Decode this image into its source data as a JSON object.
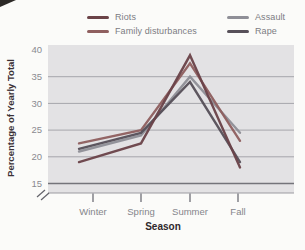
{
  "figure": {
    "background": "#fbfbf9",
    "plot_background": "#e3e2e4",
    "gridline_color": "#a6a6ac",
    "baseline_color": "#74747a",
    "tick_color": "#63636b",
    "tick_label_color": "#8a8a90",
    "category_label_color": "#85858b",
    "axis_title_color": "#3a3136"
  },
  "legend": {
    "items": [
      {
        "id": "riots",
        "label": "Riots",
        "color": "#6b4348"
      },
      {
        "id": "family",
        "label": "Family disturbances",
        "color": "#8f5f5f"
      },
      {
        "id": "assault",
        "label": "Assault",
        "color": "#8f8f97"
      },
      {
        "id": "rape",
        "label": "Rape",
        "color": "#575059"
      }
    ]
  },
  "chart_data": {
    "type": "line",
    "title": "",
    "xlabel": "Season",
    "ylabel": "Percentage of Yearly Total",
    "categories": [
      "Winter",
      "Spring",
      "Summer",
      "Fall"
    ],
    "yticks": [
      40,
      35,
      30,
      25,
      20,
      15
    ],
    "ylim": [
      15,
      40
    ],
    "axis_break": true,
    "grid": true,
    "legend_position": "top",
    "series": [
      {
        "name": "Assault",
        "color": "#8f8f97",
        "values": [
          21,
          24,
          35,
          24.5
        ]
      },
      {
        "name": "Family disturbances",
        "color": "#8f5f5f",
        "values": [
          22.5,
          25,
          37.5,
          23
        ]
      },
      {
        "name": "Rape",
        "color": "#575059",
        "values": [
          21.5,
          24.5,
          34,
          19
        ]
      },
      {
        "name": "Riots",
        "color": "#6b4348",
        "values": [
          19,
          22.5,
          39,
          18
        ]
      }
    ]
  }
}
